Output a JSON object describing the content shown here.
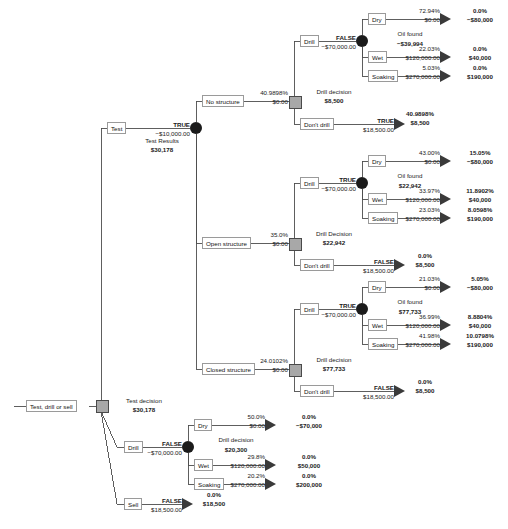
{
  "diagram": {
    "root": {
      "label": "Test, drill or sell",
      "decision_title": "Test decision",
      "decision_value": "$30,178"
    },
    "branches": {
      "test": {
        "label": "Test",
        "flag": "TRUE",
        "cost": "−$10,000.00",
        "results_title": "Test Results",
        "results_value": "$30,178"
      },
      "drill": {
        "label": "Drill",
        "flag": "FALSE",
        "cost": "−$70,000.00",
        "decision_title": "Drill decision",
        "decision_value": "$20,300",
        "outcomes": [
          {
            "label": "Dry",
            "prob": "50.0%",
            "payoff": "$0.00",
            "endprob": "0.0%",
            "endvalue": "−$70,000"
          },
          {
            "label": "Wet",
            "prob": "29.8%",
            "payoff": "$120,000.00",
            "endprob": "0.0%",
            "endvalue": "$50,000"
          },
          {
            "label": "Soaking",
            "prob": "20.2%",
            "payoff": "$270,000.00",
            "endprob": "0.0%",
            "endvalue": "$200,000"
          }
        ]
      },
      "sell": {
        "label": "Sell",
        "flag": "FALSE",
        "payoff": "$18,500.00",
        "endprob": "0.0%",
        "endvalue": "$18,500"
      }
    },
    "test_results": [
      {
        "name": "No structure",
        "prob": "40.9898%",
        "payoff": "$0.00",
        "decision_title": "Drill decision",
        "decision_value": "$8,500",
        "drill": {
          "label": "Drill",
          "flag": "FALSE",
          "cost": "−$70,000.00",
          "chance_title": "Oil found",
          "chance_value": "−$39,994",
          "outcomes": [
            {
              "label": "Dry",
              "prob": "72.94%",
              "payoff": "$0.00",
              "endprob": "0.0%",
              "endvalue": "−$80,000"
            },
            {
              "label": "Wet",
              "prob": "22.03%",
              "payoff": "$120,000.00",
              "endprob": "0.0%",
              "endvalue": "$40,000"
            },
            {
              "label": "Soaking",
              "prob": "5.03%",
              "payoff": "$270,000.00",
              "endprob": "0.0%",
              "endvalue": "$190,000"
            }
          ]
        },
        "dont_drill": {
          "label": "Don't drill",
          "flag": "TRUE",
          "payoff": "$18,500.00",
          "endprob": "40.9898%",
          "endvalue": "$8,500"
        }
      },
      {
        "name": "Open structure",
        "prob": "35.0%",
        "payoff": "$0.00",
        "decision_title": "Drill Decision",
        "decision_value": "$22,942",
        "drill": {
          "label": "Drill",
          "flag": "TRUE",
          "cost": "−$70,000.00",
          "chance_title": "Oil found",
          "chance_value": "$22,942",
          "outcomes": [
            {
              "label": "Dry",
              "prob": "43.00%",
              "payoff": "$0.00",
              "endprob": "15.05%",
              "endvalue": "−$80,000"
            },
            {
              "label": "Wet",
              "prob": "33.97%",
              "payoff": "$120,000.00",
              "endprob": "11.8902%",
              "endvalue": "$40,000"
            },
            {
              "label": "Soaking",
              "prob": "23.03%",
              "payoff": "$270,000.00",
              "endprob": "8.0598%",
              "endvalue": "$190,000"
            }
          ]
        },
        "dont_drill": {
          "label": "Don't drill",
          "flag": "FALSE",
          "payoff": "$18,500.00",
          "endprob": "0.0%",
          "endvalue": "$8,500"
        }
      },
      {
        "name": "Closed structure",
        "prob": "24.0102%",
        "payoff": "$0.00",
        "decision_title": "Drill decision",
        "decision_value": "$77,733",
        "drill": {
          "label": "Drill",
          "flag": "TRUE",
          "cost": "−$70,000.00",
          "chance_title": "Oil found",
          "chance_value": "$77,733",
          "outcomes": [
            {
              "label": "Dry",
              "prob": "21.03%",
              "payoff": "$0.00",
              "endprob": "5.05%",
              "endvalue": "−$80,000"
            },
            {
              "label": "Wet",
              "prob": "36.99%",
              "payoff": "$120,000.00",
              "endprob": "8.8804%",
              "endvalue": "$40,000"
            },
            {
              "label": "Soaking",
              "prob": "41.98%",
              "payoff": "$270,000.00",
              "endprob": "10.0798%",
              "endvalue": "$190,000"
            }
          ]
        },
        "dont_drill": {
          "label": "Don't drill",
          "flag": "FALSE",
          "payoff": "$18,500.00",
          "endprob": "0.0%",
          "endvalue": "$8,500"
        }
      }
    ]
  }
}
